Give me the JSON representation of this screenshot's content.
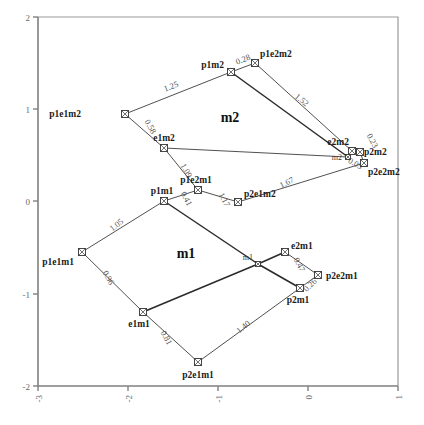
{
  "figure": {
    "type": "network-tree-plot",
    "background": "#ffffff"
  },
  "axes": {
    "x": {
      "min": -3,
      "max": 1,
      "ticks": [
        {
          "value": -3,
          "label": "-3",
          "px": 38
        },
        {
          "value": -2,
          "label": "-2",
          "px": 128
        },
        {
          "value": -1,
          "label": "-1",
          "px": 218
        },
        {
          "value": 0,
          "label": "0",
          "px": 308
        },
        {
          "value": 1,
          "label": "1",
          "px": 398
        }
      ]
    },
    "y": {
      "min": -2,
      "max": 2,
      "ticks": [
        {
          "value": 2,
          "label": "2",
          "px": 17
        },
        {
          "value": 1,
          "label": "1",
          "px": 109
        },
        {
          "value": 0,
          "label": "0",
          "px": 201
        },
        {
          "value": -1,
          "label": "-1",
          "px": 294
        },
        {
          "value": -2,
          "label": "-2",
          "px": 386
        }
      ]
    }
  },
  "cluster_labels": [
    {
      "name": "cluster-label-m2",
      "text": "m2",
      "x": 230,
      "y": 122
    },
    {
      "name": "cluster-label-m1",
      "text": "m1",
      "x": 186,
      "y": 258
    }
  ],
  "nodes": [
    {
      "id": "p1e1m2",
      "label": "p1e1m2",
      "x": 125,
      "y": 114,
      "label_dx": -44,
      "label_dy": 3,
      "anchor": "end",
      "size": "big"
    },
    {
      "id": "p1m2",
      "label": "p1m2",
      "x": 231,
      "y": 72,
      "label_dx": -7,
      "label_dy": -4,
      "anchor": "end",
      "size": "big"
    },
    {
      "id": "p1e2m2",
      "label": "p1e2m2",
      "x": 255,
      "y": 63,
      "label_dx": 5,
      "label_dy": -6,
      "anchor": "start",
      "size": "big"
    },
    {
      "id": "e1m2",
      "label": "e1m2",
      "x": 164,
      "y": 148,
      "label_dx": 0,
      "label_dy": -7,
      "anchor": "middle",
      "size": "big"
    },
    {
      "id": "e2m2",
      "label": "e2m2",
      "x": 352,
      "y": 151,
      "label_dx": -3,
      "label_dy": -6,
      "anchor": "end",
      "size": "big"
    },
    {
      "id": "p2m2",
      "label": "p2m2",
      "x": 360,
      "y": 152,
      "label_dx": 4,
      "label_dy": 3,
      "anchor": "start",
      "size": "big"
    },
    {
      "id": "p2e2m2",
      "label": "p2e2m2",
      "x": 364,
      "y": 163,
      "label_dx": 4,
      "label_dy": 12,
      "anchor": "start",
      "size": "big"
    },
    {
      "id": "m2node",
      "label": "m2",
      "x": 348,
      "y": 157,
      "label_dx": -6,
      "label_dy": 3,
      "anchor": "end",
      "size": "small"
    },
    {
      "id": "p2e1m2",
      "label": "p2e1m2",
      "x": 238,
      "y": 202,
      "label_dx": 6,
      "label_dy": -5,
      "anchor": "start",
      "size": "big"
    },
    {
      "id": "p1e2m1",
      "label": "p1e2m1",
      "x": 198,
      "y": 190,
      "label_dx": -2,
      "label_dy": -7,
      "anchor": "middle",
      "size": "big"
    },
    {
      "id": "p1m1",
      "label": "p1m1",
      "x": 164,
      "y": 201,
      "label_dx": -2,
      "label_dy": -7,
      "anchor": "middle",
      "size": "big"
    },
    {
      "id": "p1e1m1",
      "label": "p1e1m1",
      "x": 82,
      "y": 252,
      "label_dx": -8,
      "label_dy": 13,
      "anchor": "end",
      "size": "big"
    },
    {
      "id": "e1m1",
      "label": "e1m1",
      "x": 143,
      "y": 312,
      "label_dx": -4,
      "label_dy": 15,
      "anchor": "middle",
      "size": "big"
    },
    {
      "id": "p2e1m1",
      "label": "p2e1m1",
      "x": 198,
      "y": 362,
      "label_dx": 0,
      "label_dy": 16,
      "anchor": "middle",
      "size": "big"
    },
    {
      "id": "e2m1",
      "label": "e2m1",
      "x": 285,
      "y": 252,
      "label_dx": 6,
      "label_dy": -3,
      "anchor": "start",
      "size": "big"
    },
    {
      "id": "m1node",
      "label": "m1",
      "x": 258,
      "y": 264,
      "label_dx": -5,
      "label_dy": -4,
      "anchor": "end",
      "size": "small"
    },
    {
      "id": "p2e2m1",
      "label": "p2e2m1",
      "x": 318,
      "y": 275,
      "label_dx": 8,
      "label_dy": 4,
      "anchor": "start",
      "size": "big"
    },
    {
      "id": "p2m1",
      "label": "p2m1",
      "x": 300,
      "y": 288,
      "label_dx": -2,
      "label_dy": 15,
      "anchor": "middle",
      "size": "big"
    }
  ],
  "edges": [
    {
      "from": "p1e1m2",
      "to": "p1m2",
      "weight": "1.25",
      "thick": false,
      "lx": 172,
      "ly": 89,
      "rot": -21
    },
    {
      "from": "p1m2",
      "to": "p1e2m2",
      "weight": "0.28",
      "thick": false,
      "lx": 244,
      "ly": 62,
      "rot": -21
    },
    {
      "from": "p1e1m2",
      "to": "e1m2",
      "weight": "0.58",
      "thick": false,
      "lx": 148,
      "ly": 128,
      "rot": 60
    },
    {
      "from": "e1m2",
      "to": "p1e2m1",
      "weight": "1.09",
      "thick": false,
      "lx": 184,
      "ly": 172,
      "rot": 60
    },
    {
      "from": "p1e2m2",
      "to": "e2m2",
      "weight": "1.52",
      "thick": false,
      "lx": 300,
      "ly": 102,
      "rot": 40
    },
    {
      "from": "p1m2",
      "to": "m2node",
      "weight": "",
      "thick": true,
      "lx": 0,
      "ly": 0,
      "rot": 0
    },
    {
      "from": "e1m2",
      "to": "m2node",
      "weight": "",
      "thick": false,
      "lx": 0,
      "ly": 0,
      "rot": 0
    },
    {
      "from": "e2m2",
      "to": "p2m2",
      "weight": "0.23",
      "thick": false,
      "lx": 370,
      "ly": 142,
      "rot": 62
    },
    {
      "from": "p2m2",
      "to": "p2e2m2",
      "weight": "0.05",
      "thick": false,
      "lx": 354,
      "ly": 166,
      "rot": 28
    },
    {
      "from": "p2e1m2",
      "to": "p2e2m2",
      "weight": "1.67",
      "thick": false,
      "lx": 288,
      "ly": 185,
      "rot": -26
    },
    {
      "from": "p1m1",
      "to": "p1e2m1",
      "weight": "0.41",
      "thick": false,
      "lx": 184,
      "ly": 200,
      "rot": 62
    },
    {
      "from": "p1e2m1",
      "to": "p2e1m2",
      "weight": "1.17",
      "thick": false,
      "lx": 222,
      "ly": 201,
      "rot": 62
    },
    {
      "from": "p1e1m1",
      "to": "p1m1",
      "weight": "1.05",
      "thick": false,
      "lx": 118,
      "ly": 227,
      "rot": -38
    },
    {
      "from": "p1e1m1",
      "to": "e1m1",
      "weight": "0.96",
      "thick": false,
      "lx": 106,
      "ly": 279,
      "rot": 62
    },
    {
      "from": "e1m1",
      "to": "p2e1m1",
      "weight": "0.81",
      "thick": false,
      "lx": 164,
      "ly": 339,
      "rot": 62
    },
    {
      "from": "p2e1m1",
      "to": "p2m1",
      "weight": "1.40",
      "thick": false,
      "lx": 245,
      "ly": 329,
      "rot": -40
    },
    {
      "from": "p1m1",
      "to": "m1node",
      "weight": "",
      "thick": true,
      "lx": 0,
      "ly": 0,
      "rot": 0
    },
    {
      "from": "e1m1",
      "to": "m1node",
      "weight": "",
      "thick": true,
      "lx": 0,
      "ly": 0,
      "rot": 0
    },
    {
      "from": "m1node",
      "to": "e2m1",
      "weight": "",
      "thick": true,
      "lx": 0,
      "ly": 0,
      "rot": 0
    },
    {
      "from": "m1node",
      "to": "p2m1",
      "weight": "",
      "thick": true,
      "lx": 0,
      "ly": 0,
      "rot": 0
    },
    {
      "from": "e2m1",
      "to": "p2e2m1",
      "weight": "0.47",
      "thick": false,
      "lx": 297,
      "ly": 266,
      "rot": 62
    },
    {
      "from": "p2m1",
      "to": "p2e2m1",
      "weight": "0.26",
      "thick": false,
      "lx": 312,
      "ly": 287,
      "rot": -45
    }
  ],
  "chart_data": {
    "type": "scatter",
    "title": "",
    "xlabel": "",
    "ylabel": "",
    "xlim": [
      -3,
      1
    ],
    "ylim": [
      -2,
      2
    ],
    "grid": false,
    "legend": "none",
    "xticks": [
      -3,
      -2,
      -1,
      0,
      1
    ],
    "yticks": [
      -2,
      -1,
      0,
      1,
      2
    ],
    "annotations": [
      "m1",
      "m2"
    ],
    "points": [
      {
        "label": "p1e1m2",
        "x": -2.03,
        "y": 0.85
      },
      {
        "label": "p1m2",
        "x": -0.85,
        "y": 1.35
      },
      {
        "label": "p1e2m2",
        "x": -0.59,
        "y": 1.45
      },
      {
        "label": "e1m2",
        "x": -1.6,
        "y": 0.48
      },
      {
        "label": "e2m2",
        "x": 0.49,
        "y": 0.45
      },
      {
        "label": "p2m2",
        "x": 0.58,
        "y": 0.44
      },
      {
        "label": "p2e2m2",
        "x": 0.62,
        "y": 0.32
      },
      {
        "label": "m2",
        "x": 0.44,
        "y": 0.38
      },
      {
        "label": "p2e1m2",
        "x": -0.78,
        "y": -0.02
      },
      {
        "label": "p1e2m1",
        "x": -1.22,
        "y": 0.11
      },
      {
        "label": "p1m1",
        "x": -1.6,
        "y": -0.01
      },
      {
        "label": "p1e1m1",
        "x": -2.51,
        "y": -0.57
      },
      {
        "label": "e1m1",
        "x": -1.83,
        "y": -1.22
      },
      {
        "label": "p2e1m1",
        "x": -1.22,
        "y": -1.76
      },
      {
        "label": "e2m1",
        "x": -0.26,
        "y": -0.57
      },
      {
        "label": "m1",
        "x": -0.56,
        "y": -0.7
      },
      {
        "label": "p2e2m1",
        "x": 0.11,
        "y": -0.82
      },
      {
        "label": "p2m1",
        "x": -0.09,
        "y": -0.96
      }
    ],
    "edge_weights": [
      {
        "edge": "p1e1m2-p1m2",
        "value": 1.25
      },
      {
        "edge": "p1m2-p1e2m2",
        "value": 0.28
      },
      {
        "edge": "p1e1m2-e1m2",
        "value": 0.58
      },
      {
        "edge": "e1m2-p1e2m1",
        "value": 1.09
      },
      {
        "edge": "p1e2m2-e2m2",
        "value": 1.52
      },
      {
        "edge": "e2m2-p2m2",
        "value": 0.23
      },
      {
        "edge": "p2m2-p2e2m2",
        "value": 0.05
      },
      {
        "edge": "p2e1m2-p2e2m2",
        "value": 1.67
      },
      {
        "edge": "p1m1-p1e2m1",
        "value": 0.41
      },
      {
        "edge": "p1e2m1-p2e1m2",
        "value": 1.17
      },
      {
        "edge": "p1e1m1-p1m1",
        "value": 1.05
      },
      {
        "edge": "p1e1m1-e1m1",
        "value": 0.96
      },
      {
        "edge": "e1m1-p2e1m1",
        "value": 0.81
      },
      {
        "edge": "p2e1m1-p2m1",
        "value": 1.4
      },
      {
        "edge": "e2m1-p2e2m1",
        "value": 0.47
      },
      {
        "edge": "p2m1-p2e2m1",
        "value": 0.26
      }
    ]
  }
}
